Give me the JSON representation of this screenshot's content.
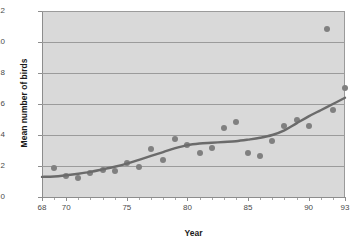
{
  "chart_data": {
    "type": "scatter",
    "title": "",
    "xlabel": "Year",
    "ylabel": "Mean number of birds",
    "xlim": [
      68,
      93
    ],
    "ylim": [
      0,
      12
    ],
    "grid": true,
    "legend": "none",
    "xticks": [
      68,
      70,
      75,
      80,
      85,
      90,
      93
    ],
    "xtick_labels": [
      "68",
      "70",
      "75",
      "80",
      "85",
      "90",
      "93"
    ],
    "yticks": [
      0,
      2,
      4,
      6,
      8,
      10,
      12
    ],
    "ytick_labels": [
      "0",
      "2",
      "4",
      "6",
      "8",
      "10",
      "12"
    ],
    "series": [
      {
        "name": "Mean number of birds",
        "marker": "circle",
        "color": "#808080",
        "x": [
          69,
          70,
          71,
          72,
          73,
          74,
          75,
          76,
          77,
          78,
          79,
          80,
          81,
          82,
          83,
          84,
          85,
          86,
          87,
          88,
          89,
          90,
          91.5,
          92,
          93
        ],
        "y": [
          1.9,
          1.35,
          1.2,
          1.55,
          1.75,
          1.65,
          2.2,
          1.95,
          3.1,
          2.4,
          3.75,
          3.35,
          2.85,
          3.15,
          4.45,
          4.85,
          2.85,
          2.65,
          3.6,
          4.6,
          4.95,
          4.55,
          10.85,
          5.6,
          7.05
        ]
      },
      {
        "name": "Fitted trend line",
        "marker": "none",
        "color": "#6b6b6b",
        "x": [
          68,
          69,
          70,
          71,
          72,
          73,
          74,
          75,
          76,
          77,
          78,
          79,
          80,
          81,
          82,
          83,
          84,
          85,
          86,
          87,
          88,
          89,
          90,
          91,
          92,
          93
        ],
        "y": [
          1.3,
          1.32,
          1.4,
          1.5,
          1.62,
          1.78,
          1.95,
          2.15,
          2.4,
          2.65,
          2.9,
          3.15,
          3.35,
          3.45,
          3.5,
          3.55,
          3.6,
          3.7,
          3.82,
          4.0,
          4.3,
          4.75,
          5.2,
          5.6,
          6.0,
          6.4
        ]
      }
    ]
  },
  "colors": {
    "plot_background": "#d9d9d9",
    "gridline": "#9b9b9b",
    "axis": "#8d8d8d",
    "marker": "#808080",
    "trend": "#6b6b6b",
    "text": "#4a4a4a",
    "title_text": "#1a1a1a"
  }
}
